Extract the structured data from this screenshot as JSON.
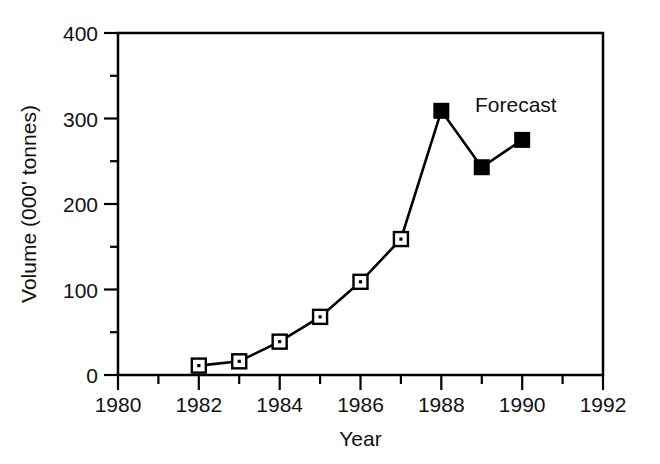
{
  "chart_data": {
    "type": "line",
    "title": "",
    "xlabel": "Year",
    "ylabel": "Volume (000' tonnes)",
    "xlim": [
      1980,
      1992
    ],
    "ylim": [
      0,
      400
    ],
    "xticks": [
      1980,
      1982,
      1984,
      1986,
      1988,
      1990,
      1992
    ],
    "xtick_labels": [
      "1980",
      "1982",
      "1984",
      "1986",
      "1988",
      "1990",
      "1992"
    ],
    "xminor_ticks": [
      1981,
      1983,
      1985,
      1987,
      1989,
      1991
    ],
    "yticks": [
      0,
      100,
      200,
      300,
      400
    ],
    "ytick_labels": [
      "0",
      "100",
      "200",
      "300",
      "400"
    ],
    "yminor_ticks": [
      50,
      150,
      250,
      350
    ],
    "grid": false,
    "legend": "none",
    "x": [
      1982,
      1983,
      1984,
      1985,
      1986,
      1987,
      1988,
      1989,
      1990
    ],
    "values": [
      11,
      16,
      39,
      68,
      109,
      159,
      309,
      243,
      275
    ],
    "series": [
      {
        "name": "Actual",
        "marker": "open-square",
        "x": [
          1982,
          1983,
          1984,
          1985,
          1986,
          1987
        ],
        "values": [
          11,
          16,
          39,
          68,
          109,
          159
        ]
      },
      {
        "name": "Forecast",
        "marker": "filled-square",
        "x": [
          1988,
          1989,
          1990
        ],
        "values": [
          309,
          243,
          275
        ]
      }
    ],
    "annotations": [
      {
        "text": "Forecast",
        "x": 1989.0,
        "y": 318
      }
    ],
    "line_color": "#000000",
    "marker_fill": "#ffffff",
    "marker_edge": "#000000"
  }
}
